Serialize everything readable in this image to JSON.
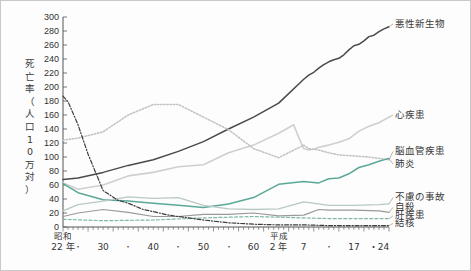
{
  "figure": {
    "y_axis_title": "死亡率（人口10万対）",
    "y_axis_title_chars": [
      "死",
      "亡",
      "率",
      "（",
      "人",
      "口",
      "1",
      "0",
      "万",
      "対",
      "）"
    ],
    "background_color": "#fdfdfd",
    "border_color": "#c9c9c9"
  },
  "chart_data": {
    "type": "line",
    "title": "",
    "subtitle": "",
    "xlabel": "",
    "ylabel": "死亡率（人口10万対）",
    "ylim": [
      0,
      300
    ],
    "xlim": [
      1947,
      2012
    ],
    "grid": false,
    "legend_position": "right-inline-labels",
    "y_ticks": [
      0,
      20,
      40,
      60,
      80,
      100,
      120,
      140,
      160,
      180,
      200,
      220,
      240,
      260,
      280,
      300
    ],
    "x_ticks": [
      {
        "year": 1947,
        "label": "22 年",
        "era": "昭和",
        "major": true
      },
      {
        "year": 1950,
        "label": "・",
        "era": "",
        "major": false
      },
      {
        "year": 1955,
        "label": "30",
        "era": "",
        "major": true
      },
      {
        "year": 1960,
        "label": "・",
        "era": "",
        "major": false
      },
      {
        "year": 1965,
        "label": "40",
        "era": "",
        "major": true
      },
      {
        "year": 1970,
        "label": "・",
        "era": "",
        "major": false
      },
      {
        "year": 1975,
        "label": "50",
        "era": "",
        "major": true
      },
      {
        "year": 1980,
        "label": "・",
        "era": "",
        "major": false
      },
      {
        "year": 1985,
        "label": "60",
        "era": "",
        "major": true
      },
      {
        "year": 1990,
        "label": "2 年",
        "era": "平成",
        "major": true
      },
      {
        "year": 1995,
        "label": "7",
        "era": "",
        "major": true
      },
      {
        "year": 2000,
        "label": "・",
        "era": "",
        "major": false
      },
      {
        "year": 2005,
        "label": "17",
        "era": "",
        "major": true
      },
      {
        "year": 2010,
        "label": "・24",
        "era": "",
        "major": true
      }
    ],
    "series": [
      {
        "name": "悪性新生物",
        "label": "悪性新生物",
        "color": "#4a4a4a",
        "style": "solid",
        "width": 1.5,
        "label_x": 1999,
        "label_y": 290,
        "x": [
          1947,
          1950,
          1955,
          1960,
          1965,
          1970,
          1975,
          1980,
          1985,
          1990,
          1995,
          1996,
          1997,
          1998,
          1999,
          2000,
          2001,
          2002,
          2003,
          2004,
          2005,
          2006,
          2007,
          2008,
          2009,
          2010,
          2011,
          2012
        ],
        "values": [
          68,
          70,
          78,
          88,
          96,
          108,
          122,
          140,
          157,
          177,
          211,
          217,
          221,
          227,
          232,
          236,
          239,
          241,
          246,
          253,
          259,
          261,
          266,
          272,
          274,
          279,
          283,
          286
        ]
      },
      {
        "name": "心疾患",
        "label": "心疾患",
        "color": "#cfcfcf",
        "style": "solid",
        "width": 1.6,
        "label_x": 1999,
        "label_y": 160,
        "x": [
          1947,
          1950,
          1955,
          1960,
          1965,
          1970,
          1975,
          1980,
          1985,
          1990,
          1993,
          1994,
          1995,
          1996,
          1997,
          1998,
          2000,
          2002,
          2004,
          2006,
          2008,
          2010,
          2012
        ],
        "values": [
          63,
          54,
          60,
          73,
          78,
          86,
          89,
          106,
          117,
          134,
          146,
          128,
          112,
          110,
          111,
          114,
          117,
          121,
          126,
          137,
          144,
          149,
          157
        ]
      },
      {
        "name": "脳血管疾患",
        "label": "脳血管疾患",
        "color": "#c4c4c4",
        "style": "dotted",
        "width": 1.6,
        "label_x": 1999,
        "label_y": 108,
        "x": [
          1947,
          1950,
          1955,
          1960,
          1965,
          1970,
          1975,
          1980,
          1985,
          1990,
          1995,
          1996,
          1998,
          2000,
          2002,
          2004,
          2006,
          2008,
          2010,
          2012
        ],
        "values": [
          124,
          127,
          136,
          160,
          175,
          175,
          157,
          139,
          112,
          99,
          117,
          112,
          110,
          106,
          103,
          102,
          101,
          100,
          98,
          96
        ]
      },
      {
        "name": "肺炎",
        "label": "肺炎",
        "color": "#5aa898",
        "style": "solid",
        "width": 1.5,
        "label_x": 1999,
        "label_y": 90,
        "x": [
          1947,
          1950,
          1955,
          1960,
          1965,
          1970,
          1975,
          1980,
          1985,
          1990,
          1995,
          1998,
          2000,
          2002,
          2004,
          2006,
          2008,
          2010,
          2012
        ],
        "values": [
          62,
          49,
          39,
          37,
          34,
          31,
          28,
          33,
          42,
          61,
          65,
          63,
          69,
          70,
          76,
          85,
          89,
          94,
          98
        ]
      },
      {
        "name": "不慮の事故",
        "label": "不慮の事故",
        "color": "#b8c9c4",
        "style": "solid",
        "width": 1.3,
        "label_x": 2001,
        "label_y": 42,
        "x": [
          1947,
          1950,
          1955,
          1960,
          1965,
          1970,
          1975,
          1980,
          1985,
          1990,
          1995,
          2000,
          2005,
          2010,
          2012
        ],
        "values": [
          23,
          32,
          37,
          43,
          41,
          42,
          31,
          26,
          25,
          26,
          36,
          31,
          31,
          32,
          33
        ]
      },
      {
        "name": "自殺",
        "label": "自殺",
        "color": "#9a9a9a",
        "style": "solid",
        "width": 1.2,
        "label_x": 2001,
        "label_y": 28,
        "x": [
          1947,
          1950,
          1955,
          1960,
          1965,
          1970,
          1975,
          1980,
          1985,
          1990,
          1995,
          1998,
          2000,
          2005,
          2010,
          2012
        ],
        "values": [
          15,
          20,
          25,
          21,
          15,
          15,
          18,
          18,
          20,
          16,
          17,
          25,
          24,
          24,
          23,
          21
        ]
      },
      {
        "name": "肝疾患",
        "label": "肝疾患",
        "color": "#7fb8a8",
        "style": "dashed",
        "width": 1.2,
        "label_x": 2001,
        "label_y": 16,
        "x": [
          1947,
          1955,
          1965,
          1975,
          1985,
          1990,
          1995,
          2000,
          2005,
          2012
        ],
        "values": [
          11,
          9,
          10,
          13,
          15,
          14,
          13,
          12,
          12,
          12
        ]
      },
      {
        "name": "結核",
        "label": "結核",
        "color": "#3d3d3d",
        "style": "dashdot",
        "width": 1.2,
        "label_x": 2001,
        "label_y": 5,
        "x": [
          1947,
          1948,
          1950,
          1952,
          1955,
          1958,
          1960,
          1963,
          1965,
          1968,
          1970,
          1975,
          1980,
          1985,
          1990,
          1995,
          2000,
          2005,
          2012
        ],
        "values": [
          187,
          179,
          146,
          104,
          52,
          38,
          34,
          25,
          22,
          17,
          15,
          10,
          6,
          4,
          3,
          3,
          2,
          2,
          2
        ]
      }
    ]
  },
  "plot": {
    "left": 62,
    "right": 388,
    "top": 16,
    "bottom": 226
  }
}
